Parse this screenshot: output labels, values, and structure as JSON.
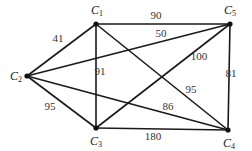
{
  "diagram": {
    "type": "weighted-graph",
    "nodes": [
      {
        "id": "C1",
        "label": "C",
        "sub": "1",
        "x": 96,
        "y": 24,
        "lx": 91,
        "ly": 14
      },
      {
        "id": "C2",
        "label": "C",
        "sub": "2",
        "x": 27,
        "y": 76,
        "lx": 10,
        "ly": 80
      },
      {
        "id": "C3",
        "label": "C",
        "sub": "3",
        "x": 96,
        "y": 128,
        "lx": 90,
        "ly": 145
      },
      {
        "id": "C4",
        "label": "C",
        "sub": "4",
        "x": 228,
        "y": 130,
        "lx": 223,
        "ly": 147
      },
      {
        "id": "C5",
        "label": "C",
        "sub": "5",
        "x": 230,
        "y": 24,
        "lx": 224,
        "ly": 14
      }
    ],
    "edges": [
      {
        "from": "C1",
        "to": "C2",
        "weight": "41",
        "lx": 58,
        "ly": 42
      },
      {
        "from": "C1",
        "to": "C5",
        "weight": "90",
        "lx": 156,
        "ly": 19
      },
      {
        "from": "C1",
        "to": "C3",
        "weight": "91",
        "lx": 100,
        "ly": 75
      },
      {
        "from": "C1",
        "to": "C4",
        "weight": "95",
        "lx": 191,
        "ly": 93
      },
      {
        "from": "C2",
        "to": "C5",
        "weight": "50",
        "lx": 161,
        "ly": 37
      },
      {
        "from": "C2",
        "to": "C3",
        "weight": "95",
        "lx": 50,
        "ly": 110
      },
      {
        "from": "C2",
        "to": "C4",
        "weight": "86",
        "lx": 168,
        "ly": 110
      },
      {
        "from": "C3",
        "to": "C5",
        "weight": "100",
        "lx": 199,
        "ly": 60
      },
      {
        "from": "C3",
        "to": "C4",
        "weight": "180",
        "lx": 153,
        "ly": 140
      },
      {
        "from": "C5",
        "to": "C4",
        "weight": "81",
        "lx": 231,
        "ly": 77
      }
    ]
  }
}
